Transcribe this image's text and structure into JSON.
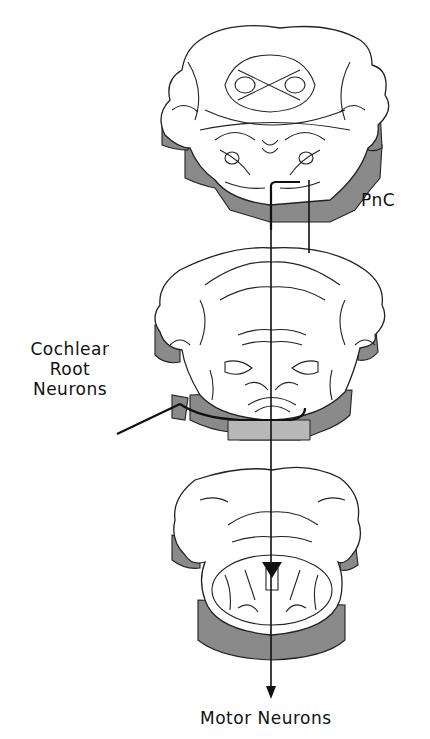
{
  "figure": {
    "labels": {
      "pnc": "PnC",
      "cochlear_line1": "Cochlear",
      "cochlear_line2": "Root",
      "cochlear_line3": "Neurons",
      "motor": "Motor Neurons"
    },
    "slices": [
      {
        "position": "top",
        "name": "rostral pons slice"
      },
      {
        "position": "middle",
        "name": "caudal pons / cochlear root slice"
      },
      {
        "position": "bottom",
        "name": "medulla slice"
      }
    ],
    "colors": {
      "stroke": "#222222",
      "slice_side": "#8a8a8a",
      "slice_side_light": "#b8b8b8",
      "background": "#ffffff",
      "text": "#111111"
    }
  }
}
